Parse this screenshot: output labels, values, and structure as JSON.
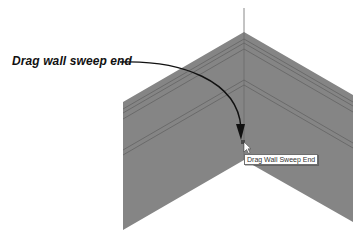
{
  "callout": {
    "label": "Drag wall sweep end"
  },
  "tooltip": {
    "text": "Drag Wall Sweep End"
  },
  "scene": {
    "wall_color": "#858585",
    "profile_line_color": "#5e5e5e",
    "arrow_color": "#111111",
    "cursor_icon": "arrow-pointer-icon"
  }
}
